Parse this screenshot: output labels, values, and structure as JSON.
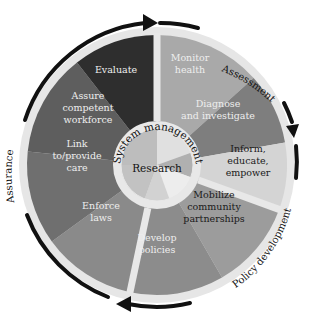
{
  "diagram": {
    "center": {
      "label": "Research",
      "ring_label": "System management"
    },
    "segments": [
      {
        "id": "monitor-health",
        "lines": [
          "Monitor",
          "health"
        ],
        "color": "#a9a9a9",
        "text_color": "#eeeeee",
        "group": "Assessment"
      },
      {
        "id": "diagnose",
        "lines": [
          "Diagnose",
          "and investigate"
        ],
        "color": "#7e7e7e",
        "text_color": "#eeeeee",
        "group": "Assessment"
      },
      {
        "id": "inform",
        "lines": [
          "Inform,",
          "educate,",
          "empower"
        ],
        "color": "#d4d4d4",
        "text_color": "#1a1a1a",
        "group": "Policy development"
      },
      {
        "id": "mobilize",
        "lines": [
          "Mobilize",
          "community",
          "partnerships"
        ],
        "color": "#9c9c9c",
        "text_color": "#1a1a1a",
        "group": "Policy development"
      },
      {
        "id": "develop-policies",
        "lines": [
          "Develop",
          "policies"
        ],
        "color": "#8c8c8c",
        "text_color": "#eeeeee",
        "group": "Policy development"
      },
      {
        "id": "enforce-laws",
        "lines": [
          "Enforce",
          "laws"
        ],
        "color": "#8a8a8a",
        "text_color": "#eeeeee",
        "group": "Assurance"
      },
      {
        "id": "link-care",
        "lines": [
          "Link",
          "to/provide",
          "care"
        ],
        "color": "#6f6f6f",
        "text_color": "#eeeeee",
        "group": "Assurance"
      },
      {
        "id": "assure-workforce",
        "lines": [
          "Assure",
          "competent",
          "workforce"
        ],
        "color": "#5e5e5e",
        "text_color": "#eeeeee",
        "group": "Assurance"
      },
      {
        "id": "evaluate",
        "lines": [
          "Evaluate"
        ],
        "color": "#2e2e2e",
        "text_color": "#eeeeee",
        "group": "Assurance"
      }
    ],
    "outer_labels": {
      "assessment": "Assessment",
      "policy_development": "Policy development",
      "assurance": "Assurance"
    },
    "colors": {
      "ring": "#e4e4e4",
      "divider": "#e8e8e8",
      "arrow": "#111111",
      "core_light": "#d0d0d0",
      "core_mid": "#b8b8b8"
    }
  }
}
